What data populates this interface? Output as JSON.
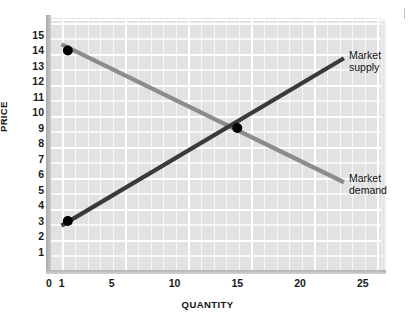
{
  "chart_data": {
    "type": "line",
    "title": "",
    "xlabel": "QUANTITY",
    "ylabel": "PRICE",
    "xlim": [
      0,
      26.5
    ],
    "ylim": [
      0,
      16.3
    ],
    "grid": true,
    "legend_position": "right-inline",
    "x_ticks": [
      0,
      1,
      5,
      10,
      15,
      20,
      25
    ],
    "x_tick_labels": [
      "0",
      "1",
      "5",
      "10",
      "15",
      "20",
      "25"
    ],
    "y_ticks": [
      1,
      2,
      3,
      4,
      5,
      6,
      7,
      8,
      9,
      10,
      11,
      12,
      13,
      14,
      15
    ],
    "y_tick_labels": [
      "1",
      "2",
      "3",
      "4",
      "5",
      "6",
      "7",
      "8",
      "9",
      "10",
      "11",
      "12",
      "13",
      "14",
      "15"
    ],
    "series": [
      {
        "name": "Market supply",
        "label_line1": "Market",
        "label_line2": "supply",
        "color": "#3a3a3a",
        "points": [
          [
            1.0,
            2.7
          ],
          [
            23.5,
            13.5
          ]
        ],
        "markers": [
          [
            1.5,
            3
          ],
          [
            15,
            9
          ]
        ]
      },
      {
        "name": "Market demand",
        "label_line1": "Market",
        "label_line2": "demand",
        "color": "#8c8c8c",
        "points": [
          [
            1.0,
            14.4
          ],
          [
            23.5,
            5.5
          ]
        ],
        "markers": [
          [
            1.5,
            14
          ],
          [
            15,
            9
          ]
        ]
      }
    ],
    "equilibrium": {
      "quantity": 15,
      "price": 9
    },
    "colors": {
      "plot_background": "#e2e2e2",
      "gridline": "#ffffff",
      "axis": "#b5b5b5",
      "supply": "#3a3a3a",
      "demand": "#8c8c8c",
      "marker": "#000000",
      "text": "#111111",
      "page_background": "#ffffff"
    }
  }
}
